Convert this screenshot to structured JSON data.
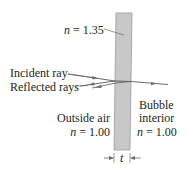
{
  "diagram": {
    "film": {
      "index_label_n": "n",
      "index_label_value": " = 1.35",
      "fill_color": "#c8c8c8",
      "edge_color": "#9a9a9a"
    },
    "rays": {
      "incident_label": "Incident ray",
      "reflected_label": "Reflected rays",
      "color": "#6b6b6b"
    },
    "outside": {
      "title": "Outside air",
      "index_n": "n",
      "index_value": " = 1.00"
    },
    "inside": {
      "title_line1": "Bubble",
      "title_line2": "interior",
      "index_n": "n",
      "index_value": " = 1.00"
    },
    "thickness": {
      "label": "t"
    }
  }
}
